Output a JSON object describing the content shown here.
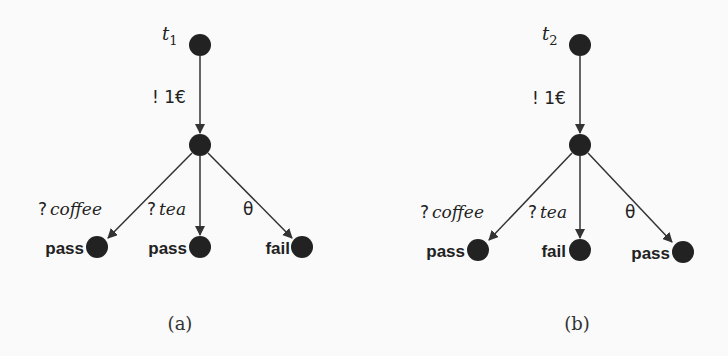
{
  "diagrams": [
    {
      "id": "a",
      "name": "t",
      "subscript": "1",
      "root_edge_label": "! 1€",
      "edges": [
        {
          "label_prefix": "?",
          "label": "coffee",
          "verdict": "pass"
        },
        {
          "label_prefix": "?",
          "label": "tea",
          "verdict": "pass"
        },
        {
          "label_prefix": "",
          "label": "θ",
          "verdict": "fail"
        }
      ],
      "caption": "(a)"
    },
    {
      "id": "b",
      "name": "t",
      "subscript": "2",
      "root_edge_label": "! 1€",
      "edges": [
        {
          "label_prefix": "?",
          "label": "coffee",
          "verdict": "pass"
        },
        {
          "label_prefix": "?",
          "label": "tea",
          "verdict": "fail"
        },
        {
          "label_prefix": "",
          "label": "θ",
          "verdict": "pass"
        }
      ],
      "caption": "(b)"
    }
  ],
  "colors": {
    "node": "#222222",
    "edge": "#333333",
    "background": "#fafafa"
  }
}
